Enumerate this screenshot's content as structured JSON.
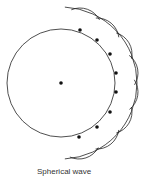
{
  "diagram": {
    "caption": "Spherical wave",
    "source_center": {
      "x": 61,
      "y": 83
    },
    "primary_radius": 54,
    "secondary_radius": 22,
    "envelope_radius": 76,
    "colors": {
      "line": "#222222",
      "dot": "#111111",
      "background": "#ffffff"
    },
    "wavelet_sources": [
      {
        "x": 80,
        "y": 30
      },
      {
        "x": 97,
        "y": 40
      },
      {
        "x": 110,
        "y": 54
      },
      {
        "x": 116,
        "y": 73
      },
      {
        "x": 116,
        "y": 92
      },
      {
        "x": 110,
        "y": 112
      },
      {
        "x": 97,
        "y": 127
      },
      {
        "x": 79,
        "y": 137
      }
    ]
  }
}
